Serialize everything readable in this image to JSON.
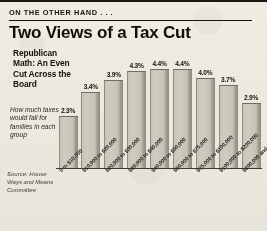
{
  "header": {
    "kicker": "ON THE OTHER HAND . . .",
    "headline": "Two Views of a Tax Cut"
  },
  "sidebar": {
    "subhead": "Republican Math: An Even Cut Across the Board",
    "caption": "How much taxes would fall for families in each group",
    "source": "Source: House Ways and Means Committee"
  },
  "colors": {
    "background": "#efece2",
    "ink": "#15120f",
    "bar_fill": "#c9c5b8",
    "bar_shadow": "#8d8a80",
    "axis": "#3d3a34"
  },
  "chart_data": {
    "type": "bar",
    "title": "Two Views of a Tax Cut",
    "subtitle": "Republican Math: An Even Cut Across the Board",
    "annotation": "How much taxes would fall for families in each group",
    "source": "Source: House Ways and Means Committee",
    "xlabel": "",
    "ylabel": "",
    "ylim": [
      0,
      4.4
    ],
    "grid": false,
    "legend": "none",
    "value_suffix": "%",
    "categories": [
      "0 to $10,000",
      "$10,000 to $20,000",
      "$20,000 to $30,000",
      "$30,000 to $40,000",
      "$40,000 to $50,000",
      "$50,000 to $75,000",
      "$75,000 to $100,000",
      "$100,000 to $200,000",
      "$200,000 and over"
    ],
    "values": [
      2.3,
      3.4,
      3.9,
      4.3,
      4.4,
      4.4,
      4.0,
      3.7,
      2.9
    ],
    "value_labels": [
      "2.3%",
      "3.4%",
      "3.9%",
      "4.3%",
      "4.4%",
      "4.4%",
      "4.0%",
      "3.7%",
      "2.9%"
    ]
  }
}
